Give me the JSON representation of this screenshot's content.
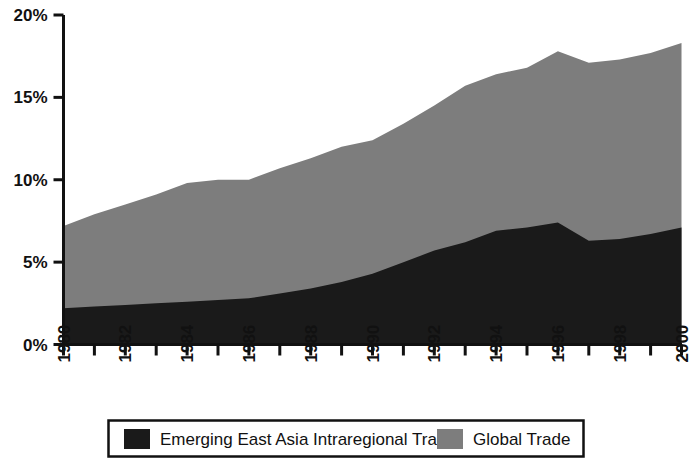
{
  "chart_data": {
    "type": "area",
    "title": "",
    "subtitle": "",
    "xlabel": "",
    "ylabel": "",
    "stacked": true,
    "grid": false,
    "legend_position": "bottom",
    "xlim": [
      1980,
      2000
    ],
    "ylim": [
      0,
      20
    ],
    "yunit": "%",
    "x": [
      1980,
      1981,
      1982,
      1983,
      1984,
      1985,
      1986,
      1987,
      1988,
      1989,
      1990,
      1991,
      1992,
      1993,
      1994,
      1995,
      1996,
      1997,
      1998,
      1999,
      2000
    ],
    "xtick_labels": [
      "1980",
      "1982",
      "1984",
      "1986",
      "1988",
      "1990",
      "1992",
      "1994",
      "1996",
      "1998",
      "2000"
    ],
    "xticks_all": [
      1980,
      1981,
      1982,
      1983,
      1984,
      1985,
      1986,
      1987,
      1988,
      1989,
      1990,
      1991,
      1992,
      1993,
      1994,
      1995,
      1996,
      1997,
      1998,
      1999,
      2000
    ],
    "ytick_labels": [
      "0%",
      "5%",
      "10%",
      "15%",
      "20%"
    ],
    "yticks": [
      0,
      5,
      10,
      15,
      20
    ],
    "series": [
      {
        "name": "Emerging East Asia Intraregional Trade",
        "color": "#1a1a1a",
        "values": [
          2.2,
          2.3,
          2.4,
          2.5,
          2.6,
          2.7,
          2.8,
          3.1,
          3.4,
          3.8,
          4.3,
          5.0,
          5.7,
          6.2,
          6.9,
          7.1,
          7.4,
          6.3,
          6.4,
          6.7,
          7.1
        ]
      },
      {
        "name": "Global Trade",
        "color": "#7d7d7d",
        "values": [
          5.0,
          5.6,
          6.1,
          6.6,
          7.2,
          7.3,
          7.2,
          7.6,
          7.9,
          8.2,
          8.1,
          8.4,
          8.8,
          9.5,
          9.5,
          9.7,
          10.4,
          10.8,
          10.9,
          11.0,
          11.2
        ]
      }
    ],
    "totals": [
      7.2,
      7.9,
      8.5,
      9.1,
      9.8,
      10.0,
      10.0,
      10.7,
      11.3,
      12.0,
      12.4,
      13.4,
      14.5,
      15.7,
      16.4,
      16.8,
      17.8,
      17.1,
      17.3,
      17.7,
      18.3
    ]
  },
  "legend": {
    "items": [
      {
        "label": "Emerging East Asia Intraregional Trade",
        "color": "#1a1a1a"
      },
      {
        "label": "Global Trade",
        "color": "#7d7d7d"
      }
    ]
  },
  "axes": {
    "y_ticks": [
      {
        "label": "20%",
        "value": 20
      },
      {
        "label": "15%",
        "value": 15
      },
      {
        "label": "10%",
        "value": 10
      },
      {
        "label": "5%",
        "value": 5
      },
      {
        "label": "0%",
        "value": 0
      }
    ],
    "x_ticks": [
      {
        "label": "1980",
        "value": 1980
      },
      {
        "label": "1982",
        "value": 1982
      },
      {
        "label": "1984",
        "value": 1984
      },
      {
        "label": "1986",
        "value": 1986
      },
      {
        "label": "1988",
        "value": 1988
      },
      {
        "label": "1990",
        "value": 1990
      },
      {
        "label": "1992",
        "value": 1992
      },
      {
        "label": "1994",
        "value": 1994
      },
      {
        "label": "1996",
        "value": 1996
      },
      {
        "label": "1998",
        "value": 1998
      },
      {
        "label": "2000",
        "value": 2000
      }
    ]
  },
  "colors": {
    "series_dark": "#1a1a1a",
    "series_gray": "#7d7d7d",
    "axis": "#111111",
    "background": "#ffffff"
  }
}
